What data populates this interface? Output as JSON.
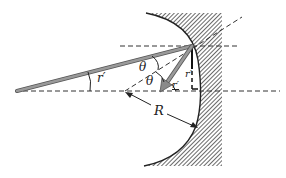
{
  "diagram": {
    "labels": {
      "ray_angle": "r′",
      "theta_upper": "θ",
      "theta_lower": "θ",
      "reflected_angle": "r′",
      "vertical_angle": "r′",
      "radius": "R"
    },
    "colors": {
      "ray": "#8a8a8a",
      "ray_edge": "#555555",
      "line": "#333333",
      "hatch": "#444444",
      "background": "#ffffff"
    }
  }
}
